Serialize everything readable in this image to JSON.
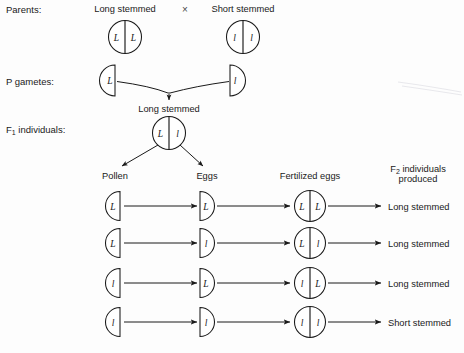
{
  "figure": {
    "type": "genetics-monohybrid-cross-diagram",
    "background_color": "#fdfdfd",
    "ink_color": "#1a1a1a"
  },
  "row_labels": {
    "parents": "Parents:",
    "p_gametes": "P gametes:",
    "f1_individuals": "F₁ individuals:"
  },
  "parents": {
    "left_phenotype": "Long stemmed",
    "cross_symbol": "×",
    "right_phenotype": "Short stemmed",
    "left_genotype": {
      "left_allele": "L",
      "right_allele": "L"
    },
    "right_genotype": {
      "left_allele": "l",
      "right_allele": "l"
    }
  },
  "p_gametes": {
    "left_allele": "L",
    "right_allele": "l",
    "fusion_result_label": "Long stemmed"
  },
  "f1": {
    "genotype": {
      "left_allele": "L",
      "right_allele": "l"
    }
  },
  "column_headers": {
    "pollen": "Pollen",
    "eggs": "Eggs",
    "fertilized_eggs": "Fertilized eggs",
    "f2_line1": "F₂ individuals",
    "f2_line2": "produced"
  },
  "crosses": [
    {
      "pollen_allele": "L",
      "egg_allele": "L",
      "zygote": {
        "left_allele": "L",
        "right_allele": "L"
      },
      "phenotype": "Long stemmed"
    },
    {
      "pollen_allele": "L",
      "egg_allele": "l",
      "zygote": {
        "left_allele": "L",
        "right_allele": "l"
      },
      "phenotype": "Long stemmed"
    },
    {
      "pollen_allele": "l",
      "egg_allele": "L",
      "zygote": {
        "left_allele": "l",
        "right_allele": "L"
      },
      "phenotype": "Long stemmed"
    },
    {
      "pollen_allele": "l",
      "egg_allele": "l",
      "zygote": {
        "left_allele": "l",
        "right_allele": "l"
      },
      "phenotype": "Short stemmed"
    }
  ]
}
